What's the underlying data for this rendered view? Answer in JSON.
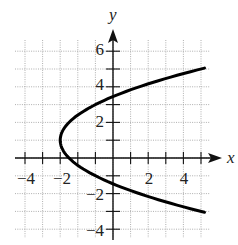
{
  "chart_data": {
    "type": "line",
    "title": "",
    "xlabel": "x",
    "ylabel": "y",
    "xlim": [
      -5.5,
      5.5
    ],
    "ylim": [
      -4.5,
      6.5
    ],
    "grid": true,
    "x_ticks": [
      -4,
      -2,
      2,
      4
    ],
    "y_ticks": [
      6,
      4,
      2,
      -2,
      -4
    ],
    "x_tick_labels": [
      "−4",
      "−2",
      "2",
      "4"
    ],
    "y_tick_labels": [
      "6",
      "4",
      "2",
      "−2",
      "−4"
    ],
    "series": [
      {
        "name": "parabola x = 0.5(y − 1)² − 3",
        "orientation": "opens right",
        "vertex": [
          -3,
          1
        ],
        "points": [
          [
            5.2,
            -3.05
          ],
          [
            3,
            -2.46
          ],
          [
            1,
            -1.83
          ],
          [
            0,
            -1.45
          ],
          [
            -1,
            -1
          ],
          [
            -2,
            -0.41
          ],
          [
            -2.5,
            0
          ],
          [
            -3,
            1
          ],
          [
            -2.5,
            2
          ],
          [
            -2,
            2.41
          ],
          [
            -1,
            3
          ],
          [
            0,
            3.45
          ],
          [
            1,
            3.83
          ],
          [
            3,
            4.46
          ],
          [
            5.2,
            5.05
          ]
        ]
      }
    ],
    "legend": null
  },
  "labels": {
    "x_axis": "x",
    "y_axis": "y",
    "xt": [
      "−4",
      "−2",
      "2",
      "4"
    ],
    "yt": [
      "6",
      "4",
      "2",
      "−2",
      "−4"
    ]
  }
}
